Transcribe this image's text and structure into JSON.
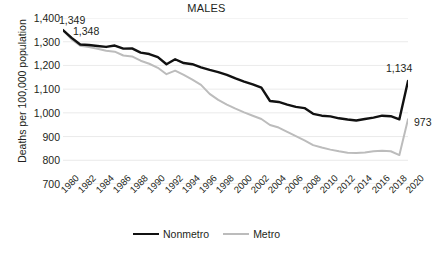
{
  "chart_data": {
    "type": "line",
    "title": "MALES",
    "xlabel": "",
    "ylabel": "Deaths per 100,000 population",
    "ylim": [
      700,
      1400
    ],
    "ytick_step": 100,
    "ytick_labels": [
      "1,400",
      "1,300",
      "1,200",
      "1,100",
      "1,000",
      "900",
      "800",
      "700"
    ],
    "ytick_values": [
      1400,
      1300,
      1200,
      1100,
      1000,
      900,
      800,
      700
    ],
    "grid": true,
    "legend_position": "bottom",
    "xlim": [
      1980,
      2020
    ],
    "x": [
      1980,
      1981,
      1982,
      1983,
      1984,
      1985,
      1986,
      1987,
      1988,
      1989,
      1990,
      1991,
      1992,
      1993,
      1994,
      1995,
      1996,
      1997,
      1998,
      1999,
      2000,
      2001,
      2002,
      2003,
      2004,
      2005,
      2006,
      2007,
      2008,
      2009,
      2010,
      2011,
      2012,
      2013,
      2014,
      2015,
      2016,
      2017,
      2018,
      2019,
      2020
    ],
    "xtick_labels": [
      "1980",
      "1982",
      "1984",
      "1986",
      "1988",
      "1990",
      "1992",
      "1994",
      "1996",
      "1998",
      "2000",
      "2002",
      "2004",
      "2006",
      "2008",
      "2010",
      "2012",
      "2014",
      "2016",
      "2018",
      "2020"
    ],
    "series": [
      {
        "name": "Nonmetro",
        "color": "#111111",
        "values": [
          1349,
          1316,
          1288,
          1286,
          1282,
          1278,
          1284,
          1271,
          1272,
          1254,
          1248,
          1235,
          1205,
          1226,
          1210,
          1205,
          1192,
          1181,
          1172,
          1160,
          1145,
          1132,
          1120,
          1106,
          1050,
          1046,
          1035,
          1025,
          1020,
          996,
          988,
          985,
          977,
          972,
          968,
          974,
          980,
          988,
          986,
          973,
          1134
        ]
      },
      {
        "name": "Metro",
        "color": "#bcbcbc",
        "values": [
          1348,
          1310,
          1283,
          1278,
          1270,
          1262,
          1258,
          1242,
          1238,
          1220,
          1207,
          1190,
          1163,
          1178,
          1160,
          1140,
          1118,
          1080,
          1055,
          1035,
          1018,
          1002,
          988,
          974,
          949,
          938,
          920,
          902,
          884,
          864,
          854,
          845,
          838,
          832,
          831,
          833,
          838,
          840,
          838,
          822,
          973
        ]
      }
    ],
    "annotations": [
      {
        "text": "1,349",
        "series": "Nonmetro",
        "year": 1980,
        "value": 1349
      },
      {
        "text": "1,348",
        "series": "Metro",
        "year": 1980,
        "value": 1348
      },
      {
        "text": "1,134",
        "series": "Nonmetro",
        "year": 2020,
        "value": 1134
      },
      {
        "text": "973",
        "series": "Metro",
        "year": 2020,
        "value": 973
      }
    ]
  }
}
